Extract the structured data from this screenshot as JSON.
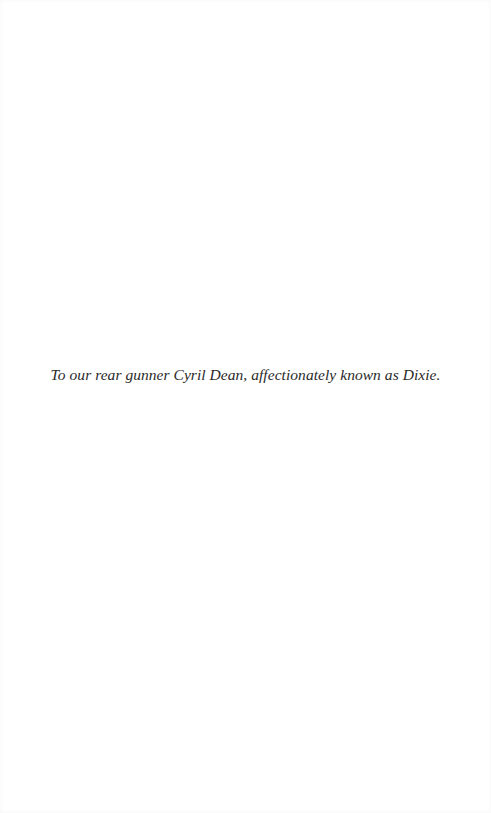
{
  "page": {
    "type": "dedication",
    "background": "#ffffff",
    "text_color": "#2a2a2a"
  },
  "dedication": {
    "text": "To our rear gunner Cyril Dean, affectionately known as Dixie."
  }
}
